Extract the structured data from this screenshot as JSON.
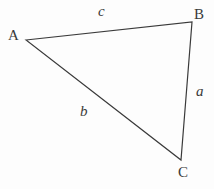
{
  "figure": {
    "kind": "triangle-diagram",
    "background_color": "#fdfdfd",
    "stroke_color": "#3a3a3a",
    "stroke_width": 1.2,
    "vertices": [
      {
        "name": "A",
        "label": "A",
        "x": 26,
        "y": 40,
        "label_x": 8,
        "label_y": 28
      },
      {
        "name": "B",
        "label": "B",
        "x": 192,
        "y": 22,
        "label_x": 194,
        "label_y": 7
      },
      {
        "name": "C",
        "label": "C",
        "x": 181,
        "y": 160,
        "label_x": 178,
        "label_y": 165
      }
    ],
    "sides": [
      {
        "name": "a",
        "label": "a",
        "between": "B-C",
        "label_x": 196,
        "label_y": 84
      },
      {
        "name": "b",
        "label": "b",
        "between": "A-C",
        "label_x": 80,
        "label_y": 104
      },
      {
        "name": "c",
        "label": "c",
        "between": "A-B",
        "label_x": 98,
        "label_y": 4
      }
    ]
  }
}
